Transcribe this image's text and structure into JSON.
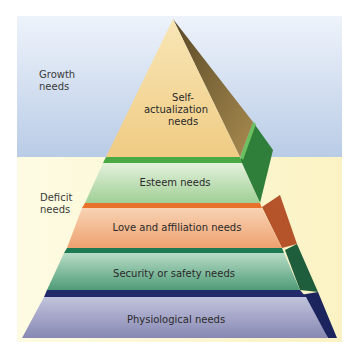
{
  "figure": {
    "type": "pyramid",
    "title": "",
    "regions": [
      {
        "label_line1": "Growth",
        "label_line2": "needs",
        "color": "#c3d3ea"
      },
      {
        "label_line1": "Deficit",
        "label_line2": "needs",
        "color": "#fbf6cf"
      }
    ],
    "tiers": [
      {
        "label_line1": "Self-",
        "label_line2": "actualization",
        "label_line3": "needs",
        "front_color": "#f4d79a",
        "band_color": "#4aa845",
        "side_color": "#8a6a3a"
      },
      {
        "label": "Esteem needs",
        "front_color": "#c8e2c0",
        "band_color": "#e8722c",
        "side_color": "#2f7f3a"
      },
      {
        "label": "Love and affiliation needs",
        "front_color": "#f2b98e",
        "band_color": "#1d7a52",
        "side_color": "#b5532a"
      },
      {
        "label": "Security or safety needs",
        "front_color": "#8ec3a6",
        "band_color": "#232a6b",
        "side_color": "#1e5e3c"
      },
      {
        "label": "Physiological needs",
        "front_color": "#a7a8c8",
        "band_color": "",
        "side_color": "#1c245e"
      }
    ]
  }
}
